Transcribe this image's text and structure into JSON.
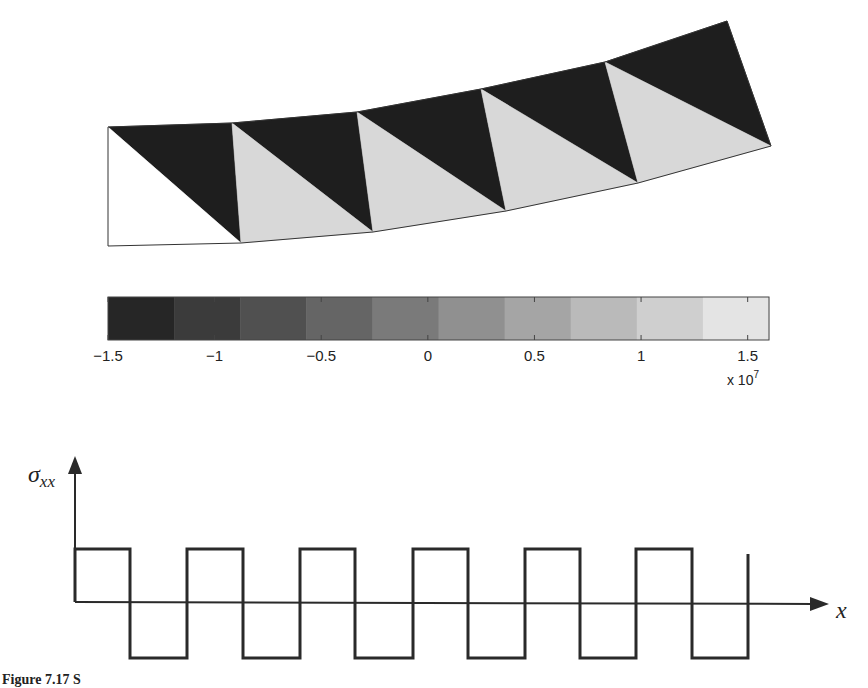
{
  "mesh": {
    "description": "Deformed cantilever beam mesh, 5 quadrilateral cells each split into two constant-strain triangles, colored by sigma_xx",
    "top_nodes": [
      [
        0,
        0
      ],
      [
        1,
        0
      ],
      [
        2,
        0
      ],
      [
        3,
        0
      ],
      [
        4,
        0
      ],
      [
        5,
        0
      ]
    ],
    "elements": 5,
    "triangles": [
      {
        "id": 1,
        "cell": 1,
        "part": "upper",
        "stress": -15000000.0,
        "shade": "dark"
      },
      {
        "id": 2,
        "cell": 1,
        "part": "lower",
        "stress": 15000000.0,
        "shade": "white"
      },
      {
        "id": 3,
        "cell": 2,
        "part": "upper",
        "stress": -15000000.0,
        "shade": "dark"
      },
      {
        "id": 4,
        "cell": 2,
        "part": "lower",
        "stress": 14000000.0,
        "shade": "light"
      },
      {
        "id": 5,
        "cell": 3,
        "part": "upper",
        "stress": -15000000.0,
        "shade": "dark"
      },
      {
        "id": 6,
        "cell": 3,
        "part": "lower",
        "stress": 14000000.0,
        "shade": "light"
      },
      {
        "id": 7,
        "cell": 4,
        "part": "upper",
        "stress": -15000000.0,
        "shade": "dark"
      },
      {
        "id": 8,
        "cell": 4,
        "part": "lower",
        "stress": 14000000.0,
        "shade": "light"
      },
      {
        "id": 9,
        "cell": 5,
        "part": "upper",
        "stress": -15000000.0,
        "shade": "dark"
      },
      {
        "id": 10,
        "cell": 5,
        "part": "lower",
        "stress": 14000000.0,
        "shade": "light"
      }
    ],
    "colors": {
      "dark": "#1e1e1e",
      "light": "#d8d8d8",
      "white": "#ffffff",
      "edge": "#333333"
    }
  },
  "colorbar": {
    "min": -1.5,
    "max": 1.6,
    "ticks": [
      -1.5,
      -1,
      -0.5,
      0,
      0.5,
      1,
      1.5
    ],
    "tick_labels": [
      "−1.5",
      "−1",
      "−0.5",
      "0",
      "0.5",
      "1",
      "1.5"
    ],
    "multiplier_label": "x 10",
    "multiplier_exponent": "7",
    "levels": 10,
    "color_low": "#262626",
    "color_high": "#e4e4e4"
  },
  "stress_plot": {
    "y_axis_label": "σ",
    "y_axis_subscript": "xx",
    "x_axis_label": "x",
    "wave": {
      "description": "Piecewise-constant sigma_xx along x, alternating positive/negative per triangle",
      "segments": [
        1,
        -1,
        1,
        -1,
        1,
        -1,
        1,
        -1,
        1,
        -1,
        1,
        -1
      ],
      "end_value": 1
    },
    "line_color": "#2a2a2a"
  },
  "caption": {
    "text": "Figure 7.17 S"
  }
}
